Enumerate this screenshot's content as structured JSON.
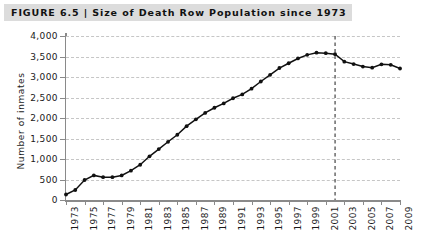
{
  "figure": {
    "label": "FIGURE 6.5",
    "separator": "|",
    "title": "Size of Death Row Population since 1973",
    "full_title": "FIGURE 6.5  |  Size of Death Row Population since 1973"
  },
  "colors": {
    "title_bar_background": "#dcdcdc",
    "title_text": "#111111",
    "series_line": "#111111",
    "series_marker": "#111111",
    "gridline": "#c6c6c6",
    "axis": "#8a8a8a",
    "event_line": "#333333",
    "plot_background": "#ffffff"
  },
  "chart_data": {
    "type": "line",
    "title": "Size of Death Row Population since 1973",
    "xlabel": "",
    "ylabel": "Number of inmates",
    "xlim": [
      1973,
      2009
    ],
    "ylim": [
      0,
      4000
    ],
    "grid": true,
    "legend": null,
    "x_tick_step": 2,
    "y_tick_step": 500,
    "y_ticks": [
      0,
      500,
      1000,
      1500,
      2000,
      2500,
      3000,
      3500,
      4000
    ],
    "y_tick_labels": [
      "0",
      "500",
      "1,000",
      "1,500",
      "2,000",
      "2,500",
      "3,000",
      "3,500",
      "4,000"
    ],
    "x_ticks": [
      1973,
      1975,
      1977,
      1979,
      1981,
      1983,
      1985,
      1987,
      1989,
      1991,
      1993,
      1995,
      1997,
      1999,
      2001,
      2003,
      2005,
      2007,
      2009
    ],
    "x_tick_labels": [
      "1973",
      "1975",
      "1977",
      "1979",
      "1981",
      "1983",
      "1985",
      "1987",
      "1989",
      "1991",
      "1993",
      "1995",
      "1997",
      "1999",
      "2001",
      "2003",
      "2005",
      "2007",
      "2009"
    ],
    "x": [
      1973,
      1974,
      1975,
      1976,
      1977,
      1978,
      1979,
      1980,
      1981,
      1982,
      1983,
      1984,
      1985,
      1986,
      1987,
      1988,
      1989,
      1990,
      1991,
      1992,
      1993,
      1994,
      1995,
      1996,
      1997,
      1998,
      1999,
      2000,
      2001,
      2002,
      2003,
      2004,
      2005,
      2006,
      2007,
      2008,
      2009
    ],
    "values": [
      134,
      244,
      488,
      600,
      557,
      556,
      599,
      715,
      860,
      1066,
      1241,
      1420,
      1591,
      1800,
      1967,
      2124,
      2250,
      2356,
      2482,
      2575,
      2716,
      2890,
      3054,
      3219,
      3335,
      3452,
      3540,
      3593,
      3581,
      3557,
      3374,
      3315,
      3254,
      3228,
      3309,
      3297,
      3207
    ],
    "series": [
      {
        "name": "Death row population",
        "values": [
          134,
          244,
          488,
          600,
          557,
          556,
          599,
          715,
          860,
          1066,
          1241,
          1420,
          1591,
          1800,
          1967,
          2124,
          2250,
          2356,
          2482,
          2575,
          2716,
          2890,
          3054,
          3219,
          3335,
          3452,
          3540,
          3593,
          3581,
          3557,
          3374,
          3315,
          3254,
          3228,
          3309,
          3297,
          3207
        ]
      }
    ],
    "annotations": [
      {
        "type": "vertical-dashed-line",
        "x": 2002,
        "label": ""
      }
    ]
  }
}
